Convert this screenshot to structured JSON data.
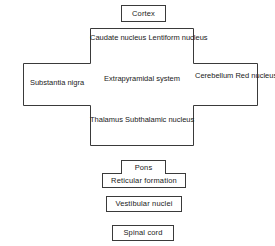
{
  "diagram": {
    "stroke_color": "#3a3a3a",
    "background_color": "#ffffff",
    "text_color": "#1a1a1a",
    "nodes": {
      "cortex": {
        "label": "Cortex"
      },
      "basal_ganglia": {
        "line1": "Caudate nucleus",
        "line2": "Lentiform nucleus"
      },
      "substantia_nigra": {
        "label": "Substantia nigra"
      },
      "center": {
        "line1": "Extrapyramidal",
        "line2": "system"
      },
      "cerebellum": {
        "line1": "Cerebellum",
        "line2": "Red nucleus"
      },
      "thalamus": {
        "line1": "Thalamus",
        "line2": "Subthalamic nucleus"
      },
      "pons": {
        "label": "Pons"
      },
      "reticular_formation": {
        "label": "Reticular formation"
      },
      "vestibular_nuclei": {
        "label": "Vestibular nuclei"
      },
      "spinal_cord": {
        "label": "Spinal cord"
      }
    }
  }
}
